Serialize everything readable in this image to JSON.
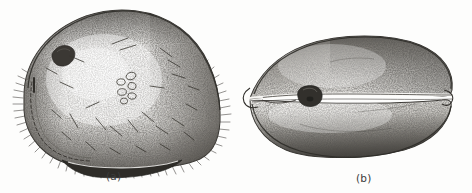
{
  "plate": {
    "width": 472,
    "height": 193,
    "background_color": "#fdfdfc",
    "ink_color": "#2b2a28",
    "style": "stipple-engraving-line-illustration",
    "subject": "specimen shown in two orientations"
  },
  "figures": [
    {
      "id": "a",
      "caption": "(a)",
      "view": "lateral-view",
      "description": "rounded ovate body with dense stippled shading, fringe of fine bristles along left and lower-right margins, a dark blemish in the upper left, a cluster of small ring-shaped markings near the centre, scattered short diagonal setae, a beaded dashed suture line along the lower left margin, and a dark lens-shaped ventral lobe at the bottom",
      "bbox": {
        "x": 14,
        "y": 8,
        "width": 210,
        "height": 162
      },
      "features": [
        {
          "name": "dark-blemish",
          "cx": 63,
          "cy": 56
        },
        {
          "name": "ring-cluster",
          "cx": 127,
          "cy": 88,
          "count": 6
        },
        {
          "name": "beaded-suture-line",
          "from_x": 22,
          "from_y": 95,
          "to_x": 86,
          "to_y": 155
        },
        {
          "name": "ventral-dark-lobe",
          "cx": 120,
          "cy": 160
        },
        {
          "name": "marginal-bristle-fringe",
          "segments": [
            "left",
            "lower-left",
            "right",
            "lower-right",
            "bottom"
          ]
        },
        {
          "name": "surface-setae",
          "count": 26
        }
      ]
    },
    {
      "id": "b",
      "caption": "(b)",
      "view": "dorsal-view",
      "description": "elongate ovoid body split by a pale horizontal cleft running the full length, pointed at the left end and broadly rounded at the right, with a small dark rounded nodule sitting astride the cleft left of centre and heavy stippled shading along the upper right and lower contours",
      "bbox": {
        "x": 248,
        "y": 35,
        "width": 206,
        "height": 122
      },
      "features": [
        {
          "name": "longitudinal-cleft",
          "from_x": 252,
          "from_y": 97,
          "to_x": 452,
          "to_y": 95
        },
        {
          "name": "dark-nodule",
          "cx": 309,
          "cy": 95
        },
        {
          "name": "pointed-left-tip",
          "cx": 250,
          "cy": 99
        },
        {
          "name": "rounded-right-end",
          "cx": 452,
          "cy": 96
        }
      ]
    }
  ]
}
